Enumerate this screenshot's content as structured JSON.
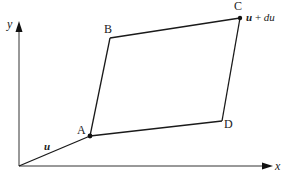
{
  "diagram": {
    "type": "deformation-parallelogram",
    "axes": {
      "x_label": "x",
      "y_label": "y",
      "origin": [
        19,
        166
      ],
      "x_tip": [
        272,
        166
      ],
      "y_tip": [
        17,
        22
      ]
    },
    "points": {
      "A": {
        "label": "A",
        "pos": [
          90,
          136
        ]
      },
      "B": {
        "label": "B",
        "pos": [
          110,
          38
        ]
      },
      "C": {
        "label": "C",
        "pos": [
          240,
          18
        ]
      },
      "D": {
        "label": "D",
        "pos": [
          222,
          121
        ]
      }
    },
    "vector_u": {
      "label": "u"
    },
    "point_c_annotation": {
      "u": "u",
      "plus": " + ",
      "du": "du"
    },
    "colors": {
      "line": "#1a1a1a",
      "background": "#ffffff"
    }
  }
}
